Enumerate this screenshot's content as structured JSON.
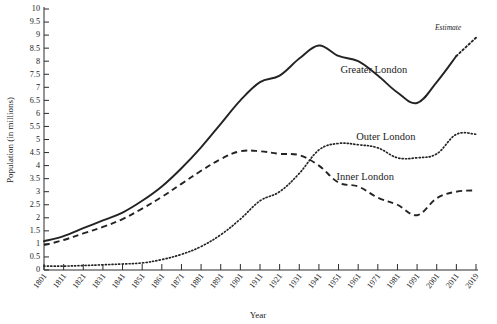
{
  "chart_data": {
    "type": "line",
    "title": "",
    "xlabel": "Year",
    "ylabel": "Population (in millions)",
    "xlim": [
      1801,
      2019
    ],
    "ylim": [
      0,
      10
    ],
    "grid": false,
    "legend_position": "inline-annotations",
    "x": [
      1801,
      1811,
      1821,
      1831,
      1841,
      1851,
      1861,
      1871,
      1881,
      1891,
      1901,
      1911,
      1921,
      1931,
      1941,
      1951,
      1961,
      1971,
      1981,
      1991,
      2001,
      2011,
      2019
    ],
    "xtick_labels": [
      "1801",
      "1811",
      "1821",
      "1831",
      "1841",
      "1851",
      "1861",
      "1871",
      "1881",
      "1891",
      "1901",
      "1911",
      "1921",
      "1931",
      "1941",
      "1951",
      "1961",
      "1971",
      "1981",
      "1991",
      "2001",
      "2011",
      "2019"
    ],
    "ytick_labels": [
      "10",
      "9.5",
      "9",
      "8.5",
      "8",
      "7.5",
      "7",
      "6.5",
      "6",
      "5.5",
      "5",
      "4.5",
      "4",
      "3.5",
      "3",
      "2.5",
      "2",
      "1.5",
      "1",
      "0.5",
      "0"
    ],
    "ytick_values": [
      10,
      9.5,
      9,
      8.5,
      8,
      7.5,
      7,
      6.5,
      6,
      5.5,
      5,
      4.5,
      4,
      3.5,
      3,
      2.5,
      2,
      1.5,
      1,
      0.5,
      0
    ],
    "series": [
      {
        "name": "Greater London",
        "style": "solid",
        "label": "Greater London",
        "label_x": 1952,
        "label_y": 7.55,
        "values": [
          1.1,
          1.3,
          1.6,
          1.9,
          2.2,
          2.65,
          3.2,
          3.9,
          4.7,
          5.6,
          6.5,
          7.2,
          7.45,
          8.1,
          8.6,
          8.2,
          8.0,
          7.45,
          6.8,
          6.4,
          7.2,
          8.2,
          8.9
        ]
      },
      {
        "name": "Inner London",
        "style": "dashed",
        "label": "Inner London",
        "label_x": 1950,
        "label_y": 3.45,
        "values": [
          0.95,
          1.15,
          1.4,
          1.65,
          1.95,
          2.35,
          2.8,
          3.3,
          3.8,
          4.25,
          4.55,
          4.55,
          4.45,
          4.4,
          4.0,
          3.35,
          3.2,
          2.77,
          2.5,
          2.1,
          2.75,
          3.0,
          3.05
        ]
      },
      {
        "name": "Outer London",
        "style": "dotted",
        "label": "Outer London",
        "label_x": 1960,
        "label_y": 5.0,
        "values": [
          0.15,
          0.15,
          0.17,
          0.2,
          0.23,
          0.27,
          0.4,
          0.6,
          0.9,
          1.35,
          1.95,
          2.65,
          3.0,
          3.7,
          4.6,
          4.85,
          4.8,
          4.68,
          4.3,
          4.3,
          4.45,
          5.2,
          5.2
        ]
      }
    ],
    "annotations": [
      {
        "name": "estimate",
        "text": "Estimate",
        "x": 2013,
        "y": 9.18,
        "note": "dotted continuation of Greater London from 2011 to 2019"
      }
    ],
    "estimate_segment": {
      "from_x": 2011,
      "from_y": 8.2,
      "to_x": 2019,
      "to_y": 8.9
    }
  }
}
